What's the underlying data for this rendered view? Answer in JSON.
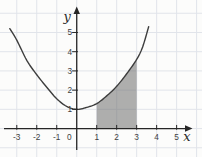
{
  "figure": {
    "background": "#fcfcfb",
    "grid_color": "#e1e4ea",
    "axis_color": "#262626",
    "curve_color": "#3d3d3d",
    "shade_fill": "#6e6e6e",
    "shade_opacity": 0.55,
    "tick_label_color": "#3f3f3f"
  },
  "chart_data": {
    "type": "line",
    "xlabel": "x",
    "ylabel": "y",
    "origin_label": "0",
    "grid": true,
    "xlim": [
      -3.84,
      6.27
    ],
    "ylim": [
      -1.48,
      6.69
    ],
    "x_ticks": [
      -3,
      -2,
      -1,
      1,
      2,
      3,
      4,
      5
    ],
    "x_tick_labels": [
      "-3",
      "-2",
      "-1",
      "1",
      "2",
      "3",
      "4",
      "5"
    ],
    "y_ticks": [
      1,
      2,
      3,
      4,
      5
    ],
    "y_tick_labels": [
      "1",
      "2",
      "3",
      "4",
      "5"
    ],
    "curve_points": [
      [
        -3.35,
        5.2
      ],
      [
        -3.0,
        4.6
      ],
      [
        -2.5,
        3.55
      ],
      [
        -2.0,
        2.8
      ],
      [
        -1.5,
        2.15
      ],
      [
        -1.0,
        1.55
      ],
      [
        -0.5,
        1.15
      ],
      [
        0.0,
        1.0
      ],
      [
        0.5,
        1.1
      ],
      [
        1.0,
        1.3
      ],
      [
        1.5,
        1.7
      ],
      [
        2.0,
        2.2
      ],
      [
        2.5,
        2.85
      ],
      [
        3.0,
        3.6
      ],
      [
        3.3,
        4.25
      ],
      [
        3.6,
        5.3
      ]
    ],
    "shaded_region": {
      "x_start": 1,
      "x_end": 3,
      "bounded_above_by": "curve",
      "bounded_below_by": "x-axis",
      "curve_points_over_region": [
        [
          1.0,
          1.3
        ],
        [
          1.5,
          1.7
        ],
        [
          2.0,
          2.2
        ],
        [
          2.5,
          2.85
        ],
        [
          3.0,
          3.6
        ]
      ]
    }
  }
}
